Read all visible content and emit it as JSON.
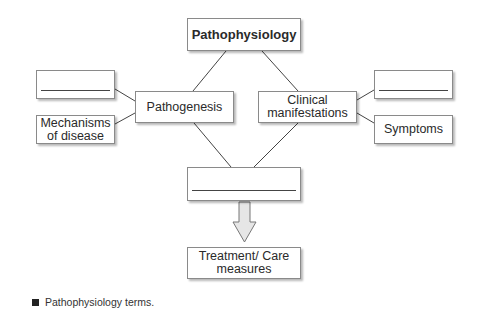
{
  "diagram": {
    "root": {
      "label": "Pathophysiology"
    },
    "pathogenesis": {
      "label": "Pathogenesis"
    },
    "clinical": {
      "label": "Clinical manifestations"
    },
    "left_blank": {
      "label": ""
    },
    "mechanisms": {
      "label": "Mechanisms of disease"
    },
    "right_blank": {
      "label": ""
    },
    "symptoms": {
      "label": "Symptoms"
    },
    "center_blank": {
      "label": ""
    },
    "treatment": {
      "label": "Treatment/ Care measures"
    }
  },
  "caption": {
    "text": "Pathophysiology terms."
  },
  "colors": {
    "border": "#8a8a8a",
    "arrow_fill": "#e6e6e6",
    "line": "#444444"
  }
}
